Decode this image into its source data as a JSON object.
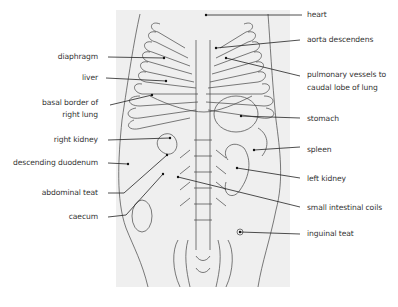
{
  "figure": {
    "background_panel_color": "#efefef",
    "line_color": "#333333"
  },
  "labels": {
    "left": [
      {
        "id": "diaphragm",
        "text": "diaphragm"
      },
      {
        "id": "liver",
        "text": "liver"
      },
      {
        "id": "basal_border",
        "line1": "basal border of",
        "line2": "right lung"
      },
      {
        "id": "right_kidney",
        "text": "right kidney"
      },
      {
        "id": "descending_duodenum",
        "text": "descending duodenum"
      },
      {
        "id": "abdominal_teat",
        "text": "abdominal teat"
      },
      {
        "id": "caecum",
        "text": "caecum"
      }
    ],
    "right": [
      {
        "id": "heart",
        "text": "heart"
      },
      {
        "id": "aorta_descendens",
        "text": "aorta descendens"
      },
      {
        "id": "pulmonary_vessels",
        "line1": "pulmonary vessels to",
        "line2": "caudal lobe of lung"
      },
      {
        "id": "stomach",
        "text": "stomach"
      },
      {
        "id": "spleen",
        "text": "spleen"
      },
      {
        "id": "left_kidney",
        "text": "left kidney"
      },
      {
        "id": "small_intestinal_coils",
        "text": "small intestinal coils"
      },
      {
        "id": "inguinal_teat",
        "text": "inguinal teat"
      }
    ]
  }
}
